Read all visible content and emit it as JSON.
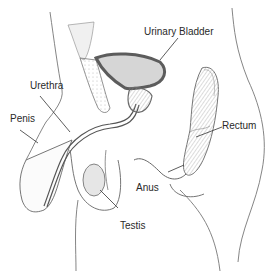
{
  "diagram": {
    "labels": [
      {
        "id": "urinary-bladder",
        "text": "Urinary Bladder"
      },
      {
        "id": "urethra",
        "text": "Urethra"
      },
      {
        "id": "penis",
        "text": "Penis"
      },
      {
        "id": "rectum",
        "text": "Rectum"
      },
      {
        "id": "anus",
        "text": "Anus"
      },
      {
        "id": "testis",
        "text": "Testis"
      }
    ],
    "colors": {
      "outline": "#555555",
      "bladder_wall": "#6a6a6a",
      "bladder_fill": "#d8d8d8",
      "rectum_fill": "#bdbdbd",
      "testis_fill": "#e4e4e4",
      "leader_line": "#333333"
    }
  }
}
